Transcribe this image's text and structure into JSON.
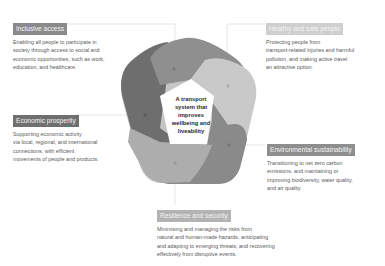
{
  "center": {
    "title_lines": [
      "A transport",
      "system that",
      "improves",
      "wellbeing and",
      "liveability"
    ]
  },
  "outcomes": [
    {
      "label": "Inclusive access",
      "description": [
        "Enabling all people to participate in",
        "society through access to social and",
        "economic opportunities, such as work,",
        "education, and healthcare."
      ],
      "color": "#8a8a8a"
    },
    {
      "label": "Healthy and safe people",
      "description": [
        "Protecting people from",
        "transport-related injuries and harmful",
        "pollution, and making active travel",
        "an attractive option."
      ],
      "color": "#cfcfcf"
    },
    {
      "label": "Environmental sustainability",
      "description": [
        "Transitioning to net zero carbon",
        "emissions, and maintaining or",
        "improving biodiversity, water quality,",
        "and air quality."
      ],
      "color": "#8e8e8e"
    },
    {
      "label": "Resilience and security",
      "description": [
        "Minimising and managing the risks from",
        "natural and human-made hazards, anticipating",
        "and adapting to emerging threats, and recovering",
        "effectively from disruptive events."
      ],
      "color": "#b3b3b3"
    },
    {
      "label": "Economic prosperity",
      "description": [
        "Supporting economic activity",
        "via local, regional, and international",
        "connections, with efficient",
        "movements of people and products."
      ],
      "color": "#6f6f6f"
    }
  ],
  "petal_colors": {
    "top": "#8f8f8f",
    "right_upper": "#c9c9c9",
    "right_lower": "#8a8a8a",
    "bottom": "#adadad",
    "left": "#6e6e6e"
  }
}
